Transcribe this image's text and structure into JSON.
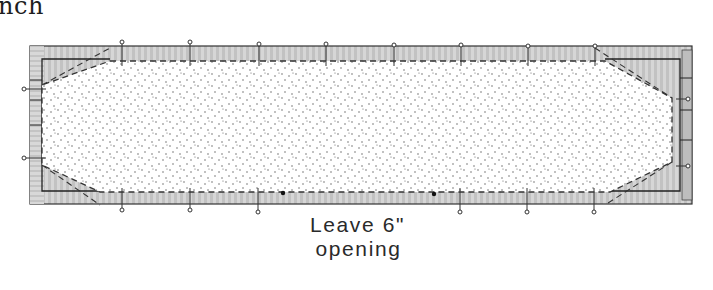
{
  "header": {
    "title_fragment": "nch"
  },
  "diagram": {
    "annotation": {
      "line1": "Leave 6\"",
      "line2": "opening"
    },
    "pins": {
      "top_x": [
        122,
        190,
        259,
        326,
        394,
        461,
        528,
        595
      ],
      "bottom_x": [
        122,
        190,
        258,
        460,
        527,
        594
      ],
      "left_y": [
        89,
        158
      ],
      "right_y": [
        99,
        166
      ]
    },
    "opening_markers": {
      "left_x": 283,
      "right_x": 434
    },
    "colors": {
      "outline": "#333333",
      "fabric_shade": "#c9c9c9",
      "fabric_light": "#e6e6e6",
      "batting_fill": "#ffffff",
      "dots": "#555555"
    },
    "icons": {
      "pin": "pin-icon",
      "opening_marker": "dot-marker-icon"
    }
  }
}
